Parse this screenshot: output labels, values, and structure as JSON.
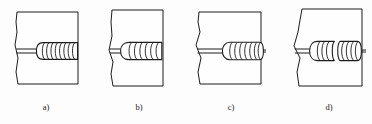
{
  "figure": {
    "kind": "technical-line-drawing",
    "background_color": "#fdfdfd",
    "line_color": "#1c1c1c",
    "plate_fill_color": "#fefefe",
    "bead_fill_color": "#ffffff",
    "panel_count": 4
  },
  "panels": [
    {
      "id": "a",
      "label": "a)",
      "label_x": 46,
      "label_y": 110,
      "plate": {
        "x": 17,
        "y": 12,
        "width": 61,
        "height": 72,
        "left_edge_wavy": true,
        "outline_path": "M 17 12 L 78 12 L 78 84 L 18 84 L 16 72 L 18 58 L 15 45 L 17 32 L 16 22 Z"
      },
      "joint": {
        "y_top": 49,
        "y_bottom": 53,
        "x_start": 16,
        "x_end": 78
      },
      "bead": {
        "x_start": 38,
        "x_end": 77,
        "center_y": 51,
        "half_height": 9,
        "ripple_count": 8,
        "has_rounded_start": true,
        "extends_past_right_edge": false,
        "description": "bead begins mid-plate with rounded crater start and runs to plate edge"
      }
    },
    {
      "id": "b",
      "label": "b)",
      "label_x": 139,
      "label_y": 110,
      "plate": {
        "x": 112,
        "y": 10,
        "width": 51,
        "height": 76,
        "left_edge_wavy": true,
        "outline_path": "M 112 10 L 163 10 L 163 86 L 113 86 L 111 74 L 113 62 L 109 50 L 112 36 L 111 22 Z"
      },
      "joint": {
        "y_top": 49,
        "y_bottom": 53,
        "x_start": 110,
        "x_end": 163
      },
      "bead": {
        "x_start": 120,
        "x_end": 162,
        "center_y": 51,
        "half_height": 9,
        "ripple_count": 6,
        "has_rounded_start": true,
        "extends_past_right_edge": false,
        "description": "bead with large bulbous start near left edge, ripples toward right edge"
      }
    },
    {
      "id": "c",
      "label": "c)",
      "label_x": 231,
      "label_y": 110,
      "plate": {
        "x": 199,
        "y": 12,
        "width": 62,
        "height": 72,
        "left_edge_wavy": true,
        "outline_path": "M 199 12 L 261 12 L 261 84 L 200 84 L 198 72 L 201 58 L 196 45 L 200 32 L 198 22 Z"
      },
      "joint": {
        "y_top": 49,
        "y_bottom": 53,
        "x_start": 197,
        "x_end": 266
      },
      "bead": {
        "x_start": 222,
        "x_end": 263,
        "center_y": 51,
        "half_height": 9,
        "ripple_count": 7,
        "has_rounded_start": true,
        "extends_past_right_edge": true,
        "description": "bead starts mid-plate and runs slightly past the right plate edge"
      }
    },
    {
      "id": "d",
      "label": "d)",
      "label_x": 329,
      "label_y": 110,
      "plate": {
        "x": 296,
        "y": 9,
        "width": 66,
        "height": 77,
        "left_edge_wavy": true,
        "outline_path": "M 302 9 L 362 9 L 362 86 L 299 86 L 297 72 L 300 58 L 294 46 L 298 32 L 300 20 Z"
      },
      "joint": {
        "y_top": 49,
        "y_bottom": 53,
        "x_start": 294,
        "x_end": 366
      },
      "bead": {
        "x_start": 310,
        "x_end": 360,
        "center_y": 51,
        "half_height": 10,
        "ripple_count": 7,
        "has_rounded_start": true,
        "has_mid_gap": true,
        "extends_past_right_edge": true,
        "description": "wide bead with a discontinuity gap in the middle, crossing the full plate"
      }
    }
  ]
}
